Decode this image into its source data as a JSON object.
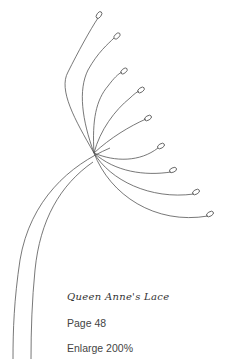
{
  "pattern": {
    "title": "Queen Anne's Lace",
    "page_label": "Page 48",
    "enlarge_label": "Enlarge 200%"
  },
  "illustration": {
    "subject": "queen-annes-lace-flower-outline",
    "stroke_color": "#555555",
    "background": "#ffffff"
  }
}
